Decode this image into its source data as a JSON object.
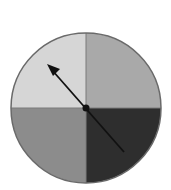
{
  "diagram": {
    "type": "spinner",
    "center": [
      86,
      108
    ],
    "radius": 75,
    "sections": [
      {
        "name": "top-left",
        "color": "#d6d6d6"
      },
      {
        "name": "top-right",
        "color": "#a9a9a9"
      },
      {
        "name": "bottom-right",
        "color": "#2e2e2e"
      },
      {
        "name": "bottom-left",
        "color": "#8c8c8c"
      }
    ],
    "outline_color": "#6a6a6a",
    "arrow": {
      "color": "#111111",
      "tip": [
        47,
        64
      ],
      "tail": [
        124,
        152
      ],
      "points_to": "top-left"
    }
  }
}
